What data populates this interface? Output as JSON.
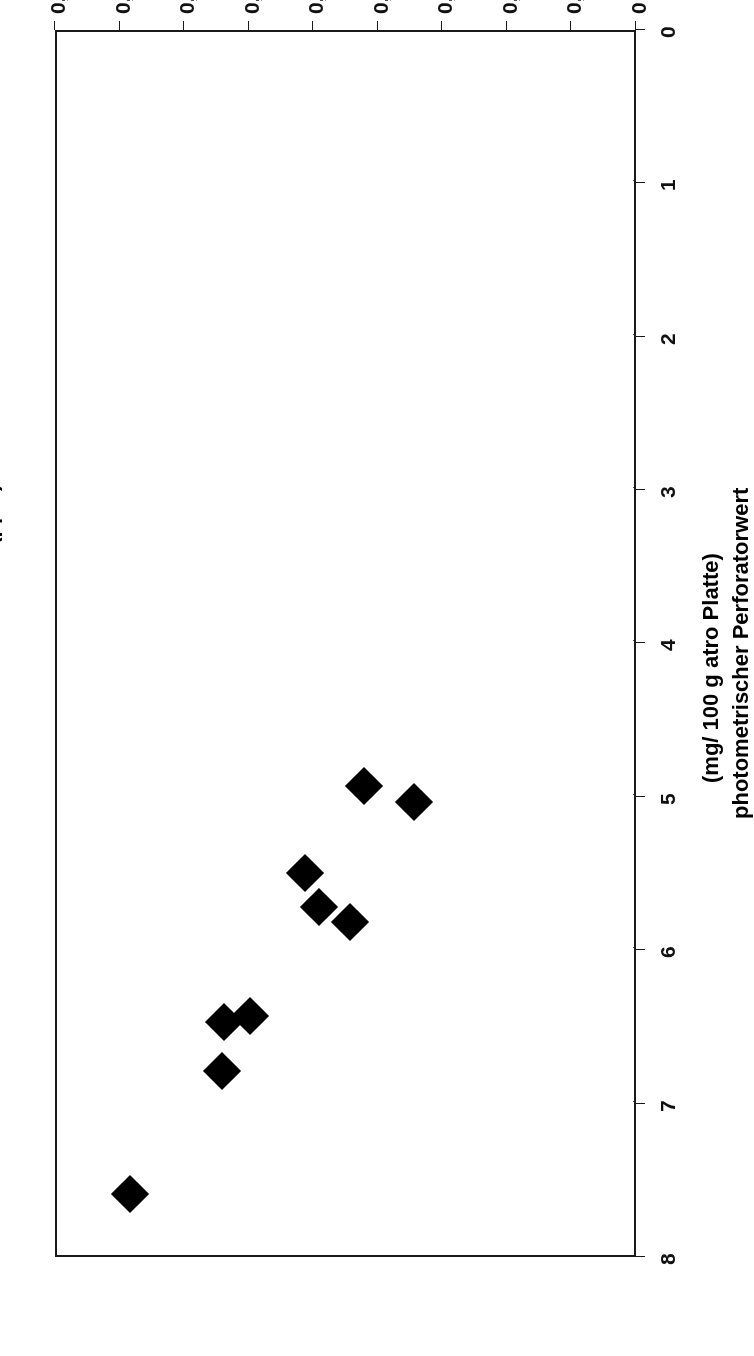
{
  "figure": {
    "orientation_note": "page scanned upside-down (rotated 180 degrees)",
    "plot_background": "#ffffff",
    "frame_color": "#1a1a1a",
    "grid_color": "#4a4a4a",
    "marker_color": "#000000"
  },
  "axes": {
    "x_title": "Prüfraumkonzentration (ppm)",
    "y_title_line1": "photometrischer Perforatorwert",
    "y_title_line2": "(mg/ 100 g atro Platte)",
    "x_ticks": [
      "0",
      "0,02",
      "0,04",
      "0,06",
      "0,08",
      "0,1",
      "0,12",
      "0,14",
      "0,16",
      "0,18"
    ],
    "y_ticks": [
      "0",
      "1",
      "2",
      "3",
      "4",
      "5",
      "6",
      "7",
      "8"
    ]
  },
  "chart_data": {
    "type": "scatter",
    "title": "",
    "xlabel": "Prüfraumkonzentration (ppm)",
    "ylabel": "photometrischer Perforatorwert (mg/ 100 g atro Platte)",
    "xlim": [
      0,
      0.18
    ],
    "ylim": [
      0,
      8
    ],
    "xtick_values": [
      0,
      0.02,
      0.04,
      0.06,
      0.08,
      0.1,
      0.12,
      0.14,
      0.16,
      0.18
    ],
    "ytick_values": [
      0,
      1,
      2,
      3,
      4,
      5,
      6,
      7,
      8
    ],
    "xtick_labels": [
      "0",
      "0,02",
      "0,04",
      "0,06",
      "0,08",
      "0,1",
      "0,12",
      "0,14",
      "0,16",
      "0,18"
    ],
    "ytick_labels": [
      "0",
      "1",
      "2",
      "3",
      "4",
      "5",
      "6",
      "7",
      "8"
    ],
    "grid": "y-gridlines only (horizontal value gridlines, shown as lines across plot)",
    "legend": null,
    "marker": "filled diamond",
    "series": [
      {
        "name": "Messpunkte",
        "points": [
          {
            "x": 0.068,
            "y": 5.05
          },
          {
            "x": 0.0835,
            "y": 4.94
          },
          {
            "x": 0.088,
            "y": 5.83
          },
          {
            "x": 0.0975,
            "y": 5.73
          },
          {
            "x": 0.102,
            "y": 5.51
          },
          {
            "x": 0.119,
            "y": 6.44
          },
          {
            "x": 0.127,
            "y": 6.48
          },
          {
            "x": 0.1275,
            "y": 6.8
          },
          {
            "x": 0.156,
            "y": 7.6
          }
        ]
      }
    ]
  }
}
